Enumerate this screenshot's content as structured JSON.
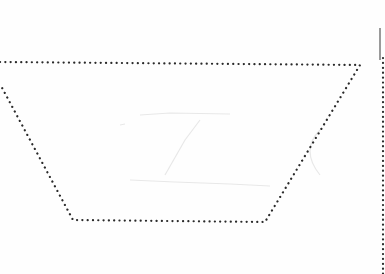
{
  "diagram": {
    "shape": "trapezoid",
    "style": "dotted-outline",
    "stroke_color": "#2a2a2a",
    "background_color": "#fefefe",
    "vertices": [
      [
        0,
        62
      ],
      [
        360,
        65
      ],
      [
        265,
        222
      ],
      [
        73,
        220
      ],
      [
        0,
        84
      ]
    ],
    "right_edge_line": {
      "x": 383,
      "y_start": 58,
      "y_end": 274,
      "style": "dotted"
    },
    "right_edge_shadow": {
      "x": 380,
      "y_start": 28,
      "y_end": 60,
      "color": "#9a9a9a"
    },
    "faint_marks_color": "#e6e6e6"
  }
}
